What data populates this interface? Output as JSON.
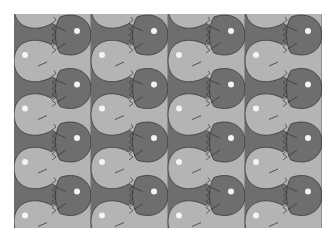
{
  "pattern": {
    "description": "Tessellated fish pattern",
    "columns": 4,
    "rows": 4,
    "tile_width": 77,
    "tile_height": 53.5,
    "colors": {
      "dark": "#6e6e6e",
      "light": "#b4b4b4",
      "outline": "#3a3a3a",
      "eye": "#f4f4f4",
      "background": "#ffffff"
    }
  }
}
